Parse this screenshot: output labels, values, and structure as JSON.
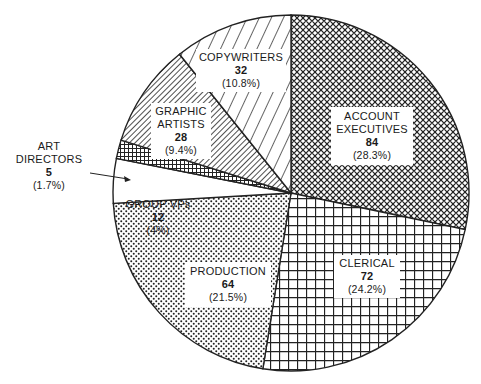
{
  "chart_data": {
    "type": "pie",
    "title": "",
    "center": [
      291,
      193
    ],
    "radius": 178,
    "start_angle_deg": -90,
    "direction": "clockwise",
    "slices": [
      {
        "label": "ACCOUNT EXECUTIVES",
        "value": 84,
        "percent": "28.3%",
        "pattern": "crosshatch-diamond"
      },
      {
        "label": "CLERICAL",
        "value": 72,
        "percent": "24.2%",
        "pattern": "grid"
      },
      {
        "label": "PRODUCTION",
        "value": 64,
        "percent": "21.5%",
        "pattern": "dots"
      },
      {
        "label": "GROUP VPs",
        "value": 12,
        "percent": "4%",
        "pattern": "blank"
      },
      {
        "label": "ART DIRECTORS",
        "value": 5,
        "percent": "1.7%",
        "pattern": "fine-grid"
      },
      {
        "label": "GRAPHIC ARTISTS",
        "value": 28,
        "percent": "9.4%",
        "pattern": "dense-diagonal"
      },
      {
        "label": "COPYWRITERS",
        "value": 32,
        "percent": "10.8%",
        "pattern": "sparse-diagonal"
      }
    ],
    "total": 297
  },
  "labels": {
    "account_execs": {
      "line1": "ACCOUNT",
      "line2": "EXECUTIVES",
      "value": "84",
      "pct": "(28.3%)"
    },
    "clerical": {
      "line1": "CLERICAL",
      "value": "72",
      "pct": "(24.2%)"
    },
    "production": {
      "line1": "PRODUCTION",
      "value": "64",
      "pct": "(21.5%)"
    },
    "group_vps": {
      "line1": "GROUP VPs",
      "value": "12",
      "pct": "(4%)"
    },
    "art_directors": {
      "line1": "ART",
      "line2": "DIRECTORS",
      "value": "5",
      "pct": "(1.7%)"
    },
    "graphic_artists": {
      "line1": "GRAPHIC",
      "line2": "ARTISTS",
      "value": "28",
      "pct": "(9.4%)"
    },
    "copywriters": {
      "line1": "COPYWRITERS",
      "value": "32",
      "pct": "(10.8%)"
    }
  }
}
